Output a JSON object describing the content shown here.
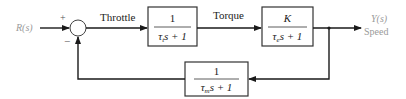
{
  "diagram": {
    "type": "feedback-block-diagram",
    "input": {
      "label": "R(s)",
      "color": "#9a9a9a"
    },
    "output": {
      "label": "Y(s)",
      "sublabel": "Speed",
      "color": "#9a9a9a"
    },
    "summing_junction": {
      "plus_sign": "+",
      "minus_sign": "−"
    },
    "signals": {
      "throttle": "Throttle",
      "torque": "Torque"
    },
    "blocks": {
      "throttle_block": {
        "numerator": "1",
        "den_tau": "τ",
        "den_sub": "t",
        "den_rest": "s + 1"
      },
      "engine_block": {
        "numerator": "K",
        "den_tau": "τ",
        "den_sub": "e",
        "den_rest": "s + 1"
      },
      "feedback_block": {
        "numerator": "1",
        "den_tau": "τ",
        "den_sub": "m",
        "den_rest": "s + 1"
      }
    },
    "colors": {
      "line": "#1a1a1a",
      "block_border": "#333333",
      "faded_text": "#9a9a9a"
    }
  }
}
